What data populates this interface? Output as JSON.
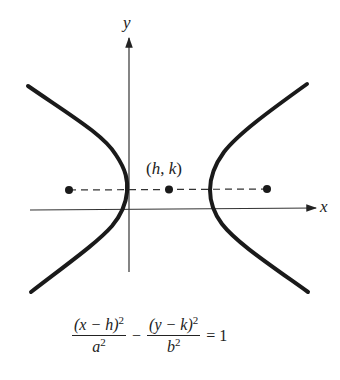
{
  "figure": {
    "type": "hyperbola",
    "orientation": "horizontal transverse axis",
    "axes": {
      "x_label": "x",
      "y_label": "y"
    },
    "center_label": {
      "open": "(",
      "h": "h",
      "sep": ", ",
      "k": "k",
      "close": ")"
    },
    "points": [
      "left focus",
      "center (h, k)",
      "right focus"
    ],
    "equation": {
      "numerator_1": "(x − h)",
      "denominator_1": "a",
      "operator": "−",
      "numerator_2": "(y − k)",
      "denominator_2": "b",
      "exponent": "2",
      "equals": "=",
      "rhs": "1"
    },
    "colors": {
      "curve": "#1a1a1a",
      "axes": "#333333",
      "background": "#ffffff"
    }
  }
}
